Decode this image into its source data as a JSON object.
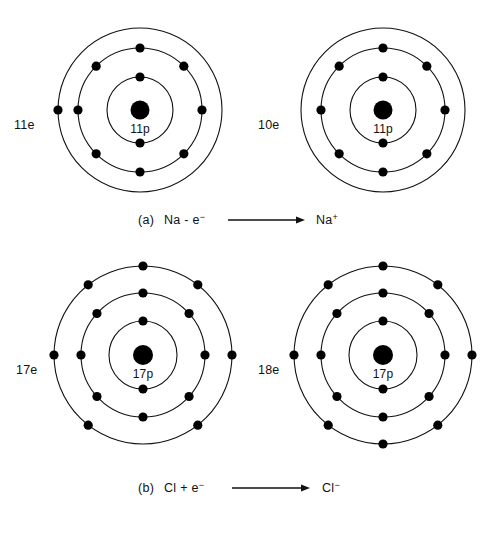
{
  "figure": {
    "background_color": "#ffffff",
    "ink_color": "#111111",
    "width": 492,
    "height": 535
  },
  "atoms": [
    {
      "id": "na-atom",
      "name": "sodium-atom",
      "nucleus_label": "11p",
      "electron_count_label": "11e",
      "center": {
        "x": 140,
        "y": 110
      },
      "nucleus_radius": 9.5,
      "shells": [
        {
          "radius": 33,
          "electrons": 2,
          "angles": [
            270,
            90
          ]
        },
        {
          "radius": 62,
          "electrons": 8,
          "angles": [
            270,
            315,
            0,
            45,
            90,
            135,
            180,
            225
          ]
        },
        {
          "radius": 82,
          "electrons": 1,
          "angles": [
            180
          ]
        }
      ],
      "label_pos": {
        "x": 14,
        "y": 129
      }
    },
    {
      "id": "na-ion",
      "name": "sodium-ion",
      "nucleus_label": "11p",
      "electron_count_label": "10e",
      "center": {
        "x": 383,
        "y": 110
      },
      "nucleus_radius": 9.5,
      "shells": [
        {
          "radius": 33,
          "electrons": 2,
          "angles": [
            270,
            90
          ]
        },
        {
          "radius": 62,
          "electrons": 8,
          "angles": [
            270,
            315,
            0,
            45,
            90,
            135,
            180,
            225
          ]
        },
        {
          "radius": 82,
          "electrons": 0,
          "angles": []
        }
      ],
      "label_pos": {
        "x": 258,
        "y": 129
      }
    },
    {
      "id": "cl-atom",
      "name": "chlorine-atom",
      "nucleus_label": "17p",
      "electron_count_label": "17e",
      "center": {
        "x": 143,
        "y": 355
      },
      "nucleus_radius": 10,
      "shells": [
        {
          "radius": 34,
          "electrons": 2,
          "angles": [
            270,
            90
          ]
        },
        {
          "radius": 62,
          "electrons": 8,
          "angles": [
            270,
            318,
            0,
            42,
            90,
            138,
            180,
            222
          ]
        },
        {
          "radius": 89,
          "electrons": 7,
          "angles": [
            270,
            308,
            0,
            52,
            128,
            180,
            232
          ]
        }
      ],
      "label_pos": {
        "x": 16,
        "y": 374
      }
    },
    {
      "id": "cl-ion",
      "name": "chloride-ion",
      "nucleus_label": "17p",
      "electron_count_label": "18e",
      "center": {
        "x": 383,
        "y": 355
      },
      "nucleus_radius": 10,
      "shells": [
        {
          "radius": 34,
          "electrons": 2,
          "angles": [
            270,
            90
          ]
        },
        {
          "radius": 62,
          "electrons": 8,
          "angles": [
            270,
            318,
            0,
            42,
            90,
            138,
            180,
            222
          ]
        },
        {
          "radius": 89,
          "electrons": 8,
          "angles": [
            270,
            308,
            0,
            52,
            90,
            128,
            180,
            232
          ]
        }
      ],
      "label_pos": {
        "x": 258,
        "y": 374
      }
    }
  ],
  "captions": [
    {
      "id": "caption-a",
      "name": "caption-reaction-a",
      "tag": "(a)",
      "reactant": "Na - e",
      "reactant_sup": "−",
      "product": "Na",
      "product_sup": "+",
      "arrow": "⟶",
      "x": 138,
      "y": 224,
      "arrow_start_x": 228,
      "arrow_end_x": 305,
      "arrow_y": 220,
      "product_x": 316
    },
    {
      "id": "caption-b",
      "name": "caption-reaction-b",
      "tag": "(b)",
      "reactant": "Cl + e",
      "reactant_sup": "−",
      "product": "Cl",
      "product_sup": "−",
      "arrow": "⟶",
      "x": 138,
      "y": 492,
      "arrow_start_x": 232,
      "arrow_end_x": 310,
      "arrow_y": 488,
      "product_x": 322
    }
  ]
}
